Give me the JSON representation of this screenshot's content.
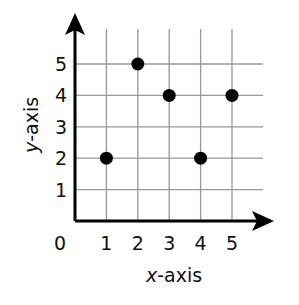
{
  "chart_data": {
    "type": "scatter",
    "title": "",
    "xlabel": "x-axis",
    "ylabel": "y-axis",
    "xlabel_var": "x",
    "xlabel_rest": "-axis",
    "ylabel_var": "y",
    "ylabel_rest": "-axis",
    "x_ticks": [
      "0",
      "1",
      "2",
      "3",
      "4",
      "5"
    ],
    "y_ticks": [
      "1",
      "2",
      "3",
      "4",
      "5"
    ],
    "xlim": [
      0,
      6
    ],
    "ylim": [
      0,
      6
    ],
    "grid": true,
    "points": [
      {
        "x": 1,
        "y": 2
      },
      {
        "x": 2,
        "y": 5
      },
      {
        "x": 3,
        "y": 4
      },
      {
        "x": 4,
        "y": 2
      },
      {
        "x": 5,
        "y": 4
      }
    ],
    "colors": {
      "point": "#000000",
      "grid": "#999999",
      "axis": "#000000"
    }
  }
}
